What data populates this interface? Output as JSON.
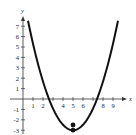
{
  "chart_data": {
    "type": "line",
    "title": "",
    "xlabel": "x",
    "ylabel": "y",
    "xlim": [
      -1,
      10
    ],
    "ylim": [
      -3,
      8
    ],
    "x_ticks": [
      1,
      2,
      4,
      5,
      6,
      8,
      9
    ],
    "y_ticks": [
      7,
      6,
      5,
      4,
      3,
      2,
      1,
      -1,
      -2,
      -3
    ],
    "grid": false,
    "legend": null,
    "series": [
      {
        "name": "parabola",
        "equation_estimate": "y = 0.52(x - 5)^2 - 3",
        "x": [
          0.5,
          1,
          2,
          3,
          4,
          5,
          6,
          7,
          8,
          9,
          9.5
        ],
        "y": [
          7.5,
          5.3,
          1.7,
          -0.9,
          -2.5,
          -3,
          -2.5,
          -0.9,
          1.7,
          5.3,
          7.5
        ],
        "color": "#111111"
      }
    ],
    "points": [
      {
        "x": 5,
        "y": -3,
        "label": "vertex"
      },
      {
        "x": 5,
        "y": -2.5,
        "label": ""
      }
    ]
  },
  "labels": {
    "x_axis": "x",
    "y_axis": "y",
    "ticks_x": [
      "1",
      "2",
      "4",
      "5",
      "6",
      "8",
      "9"
    ],
    "ticks_y": [
      "7",
      "6",
      "5",
      "4",
      "3",
      "2",
      "1",
      "-1",
      "-2",
      "-3"
    ]
  }
}
